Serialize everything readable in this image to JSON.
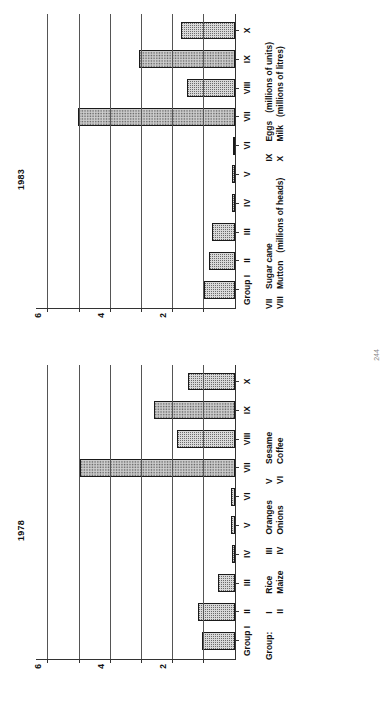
{
  "document": {
    "page_number": "244"
  },
  "charts": [
    {
      "title": "1978",
      "axis_group_label": "Group",
      "first_tick_label": "I",
      "y_ticks": [
        {
          "value": 6,
          "label": "6"
        },
        {
          "value": 5,
          "label": ""
        },
        {
          "value": 4,
          "label": "4"
        },
        {
          "value": 3,
          "label": ""
        },
        {
          "value": 2,
          "label": "2"
        },
        {
          "value": 1,
          "label": ""
        }
      ],
      "legend_title": "Group:",
      "legend_columns": [
        {
          "rows": [
            {
              "num": "I",
              "name": "Rice",
              "unit": ""
            },
            {
              "num": "II",
              "name": "Maize",
              "unit": ""
            }
          ]
        },
        {
          "rows": [
            {
              "num": "III",
              "name": "Oranges",
              "unit": ""
            },
            {
              "num": "IV",
              "name": "Onions",
              "unit": ""
            }
          ]
        },
        {
          "rows": [
            {
              "num": "V",
              "name": "Sesame",
              "unit": ""
            },
            {
              "num": "VI",
              "name": "Coffee",
              "unit": ""
            }
          ]
        }
      ]
    },
    {
      "title": "1983",
      "axis_group_label": "Group",
      "first_tick_label": "I",
      "y_ticks": [
        {
          "value": 6,
          "label": "6"
        },
        {
          "value": 5,
          "label": ""
        },
        {
          "value": 4,
          "label": "4"
        },
        {
          "value": 3,
          "label": ""
        },
        {
          "value": 2,
          "label": "2"
        },
        {
          "value": 1,
          "label": ""
        }
      ],
      "legend_title": "",
      "legend_columns": [
        {
          "rows": [
            {
              "num": "VII",
              "name": "Sugar cane",
              "unit": ""
            },
            {
              "num": "VIII",
              "name": "Mutton",
              "unit": "(millions of heads)"
            }
          ]
        },
        {
          "rows": [
            {
              "num": "IX",
              "name": "Eggs",
              "unit": "(millions of units)"
            },
            {
              "num": "X",
              "name": "Milk",
              "unit": "(millions of litres)"
            }
          ]
        }
      ]
    }
  ],
  "chart_data": [
    {
      "type": "bar",
      "title": "1978",
      "xlabel": "Group",
      "ylabel": "",
      "ylim": [
        0,
        6.4
      ],
      "grid": true,
      "categories": [
        "I",
        "II",
        "III",
        "IV",
        "V",
        "VI",
        "VII",
        "VIII",
        "IX",
        "X"
      ],
      "category_names": [
        "Rice",
        "Maize",
        "Oranges",
        "Onions",
        "Sesame",
        "Coffee",
        "Sugar cane",
        "Mutton",
        "Eggs",
        "Milk"
      ],
      "values": [
        1.05,
        1.2,
        0.55,
        0.1,
        0.12,
        0.12,
        5.0,
        1.85,
        2.6,
        1.5
      ],
      "tick_labels": [
        "6",
        "4",
        "2"
      ],
      "legend_position": "below"
    },
    {
      "type": "bar",
      "title": "1983",
      "xlabel": "Group",
      "ylabel": "",
      "ylim": [
        0,
        6.4
      ],
      "grid": true,
      "categories": [
        "I",
        "II",
        "III",
        "IV",
        "V",
        "VI",
        "VII",
        "VIII",
        "IX",
        "X"
      ],
      "category_names": [
        "Rice",
        "Maize",
        "Oranges",
        "Onions",
        "Sesame",
        "Coffee",
        "Sugar cane",
        "Mutton",
        "Eggs",
        "Milk"
      ],
      "values": [
        1.0,
        0.85,
        0.75,
        0.1,
        0.1,
        0.05,
        5.05,
        1.55,
        3.1,
        1.75
      ],
      "tick_labels": [
        "6",
        "4",
        "2"
      ],
      "legend_position": "below"
    }
  ]
}
